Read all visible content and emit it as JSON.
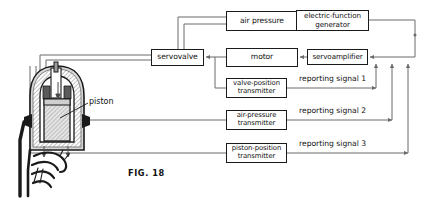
{
  "figure": {
    "caption": "FIG. 18",
    "callout_label": "piston"
  },
  "blocks": [
    {
      "id": "air-pressure",
      "label": "air pressure",
      "lines": [
        "air pressure"
      ],
      "x": 226,
      "y": 11,
      "w": 72,
      "h": 20,
      "fs": 7.6
    },
    {
      "id": "electric-function-generator",
      "label": "electric-function generator",
      "lines": [
        "electric-function",
        "generator"
      ],
      "x": 296,
      "y": 10,
      "w": 73,
      "h": 21,
      "fs": 7.2
    },
    {
      "id": "servovalve",
      "label": "servovalve",
      "lines": [
        "servovalve"
      ],
      "x": 151,
      "y": 49,
      "w": 53,
      "h": 17,
      "fs": 7.6
    },
    {
      "id": "motor",
      "label": "motor",
      "lines": [
        "motor"
      ],
      "x": 226,
      "y": 48,
      "w": 72,
      "h": 19,
      "fs": 7.6
    },
    {
      "id": "servoamplifier",
      "label": "servoamplifier",
      "lines": [
        "servoamplifier"
      ],
      "x": 307,
      "y": 49,
      "w": 61,
      "h": 16,
      "fs": 7.2
    },
    {
      "id": "valve-position-transmitter",
      "label": "valve-position transmitter",
      "lines": [
        "valve-position",
        "transmitter"
      ],
      "x": 226,
      "y": 78,
      "w": 61,
      "h": 20,
      "fs": 6.9
    },
    {
      "id": "air-pressure-transmitter",
      "label": "air-pressure transmitter",
      "lines": [
        "air-pressure",
        "transmitter"
      ],
      "x": 226,
      "y": 110,
      "w": 61,
      "h": 20,
      "fs": 6.9
    },
    {
      "id": "piston-position-transmitter",
      "label": "piston-position transmitter",
      "lines": [
        "piston-position",
        "transmitter"
      ],
      "x": 226,
      "y": 143,
      "w": 61,
      "h": 20,
      "fs": 6.9
    }
  ],
  "signal_labels": [
    {
      "id": "reporting-signal-1",
      "text": "reporting signal 1",
      "x": 299,
      "y": 74,
      "fs": 7.6
    },
    {
      "id": "reporting-signal-2",
      "text": "reporting signal 2",
      "x": 299,
      "y": 106,
      "fs": 7.6
    },
    {
      "id": "reporting-signal-3",
      "text": "reporting signal 3",
      "x": 299,
      "y": 139,
      "fs": 7.6
    }
  ],
  "colors": {
    "line": "#4a4a4a",
    "block_border": "#1a1a1a",
    "text": "#111111",
    "apparatus_outline": "#1a1a1a",
    "hatch": "#8c8c8c",
    "body_fill": "#d8d8d8"
  }
}
